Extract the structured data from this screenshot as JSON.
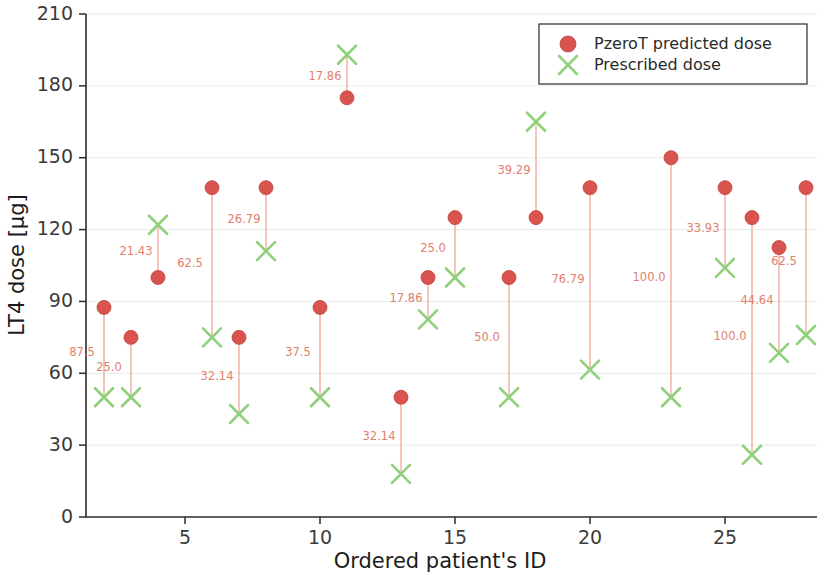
{
  "chart_data": {
    "type": "scatter",
    "title": "",
    "xlabel": "Ordered patient's ID",
    "ylabel": "LT4 dose [µg]",
    "xlim": [
      1,
      29
    ],
    "ylim": [
      0,
      210
    ],
    "xticks": [
      5,
      10,
      15,
      20,
      25
    ],
    "yticks": [
      0,
      30,
      60,
      90,
      120,
      150,
      180,
      210
    ],
    "grid": false,
    "legend_position": "top-right",
    "legend": [
      {
        "label": "PzeroT predicted dose",
        "marker": "circle",
        "color": "#d9534f"
      },
      {
        "label": "Prescribed dose",
        "marker": "x",
        "color": "#8fd07a"
      }
    ],
    "x": [
      2,
      3,
      4,
      6,
      7,
      8,
      10,
      11,
      13,
      14,
      15,
      17,
      18,
      20,
      23,
      25,
      26,
      27,
      28
    ],
    "series": [
      {
        "name": "PzeroT predicted dose",
        "values": [
          87.5,
          75.0,
          100.0,
          137.5,
          75.0,
          137.5,
          87.5,
          175.0,
          50.0,
          100.0,
          125.0,
          100.0,
          125.0,
          137.5,
          150.0,
          137.5,
          125.0,
          112.5,
          137.5
        ]
      },
      {
        "name": "Prescribed dose",
        "values": [
          50.0,
          50.0,
          122.0,
          75.0,
          43.0,
          111.0,
          50.0,
          193.0,
          18.0,
          82.5,
          100.0,
          50.0,
          165.0,
          61.5,
          50.0,
          104.0,
          26.0,
          68.5,
          76.0
        ]
      }
    ],
    "annotations": [
      "87.5",
      "25.0",
      "21.43",
      "62.5",
      "32.14",
      "26.79",
      "37.5",
      "17.86",
      "32.14",
      "17.86",
      "25.0",
      "50.0",
      "39.29",
      "76.79",
      "100.0",
      "33.93",
      "100.0",
      "44.64",
      "62.5"
    ]
  }
}
